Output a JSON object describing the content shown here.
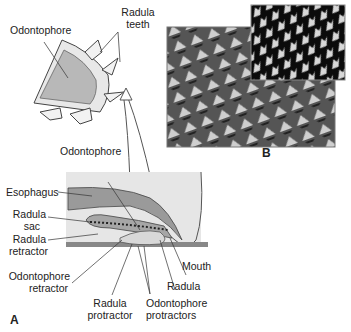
{
  "figure": {
    "panel_a_label": "A",
    "panel_b_label": "B",
    "colors": {
      "odontophore_fill": "#b8b8b8",
      "tissue_fill": "#e6e6e6",
      "esophagus_fill": "#9a9a9a",
      "substrate": "#888888",
      "sem_background": "#111111"
    },
    "inset_labels": {
      "odontophore": "Odontophore",
      "radula_teeth_1": "Radula",
      "radula_teeth_2": "teeth"
    },
    "main_labels": {
      "odontophore": "Odontophore",
      "esophagus": "Esophagus",
      "radula_sac_1": "Radula",
      "radula_sac_2": "sac",
      "radula_retractor_1": "Radula",
      "radula_retractor_2": "retractor",
      "odontophore_retractor_1": "Odontophore",
      "odontophore_retractor_2": "retractor",
      "mouth": "Mouth",
      "radula": "Radula",
      "radula_protractor_1": "Radula",
      "radula_protractor_2": "protractor",
      "odontophore_protractors_1": "Odontophore",
      "odontophore_protractors_2": "protractors"
    }
  }
}
